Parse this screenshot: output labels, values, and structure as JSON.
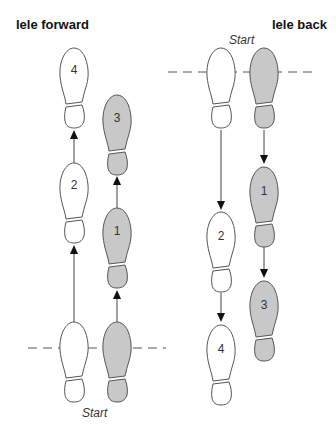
{
  "diagram": {
    "left": {
      "title": "lele forward",
      "start_label": "Start",
      "steps": [
        {
          "label": "1",
          "foot": "right",
          "fill": "#c8c8c8"
        },
        {
          "label": "2",
          "foot": "left",
          "fill": "#ffffff"
        },
        {
          "label": "3",
          "foot": "right",
          "fill": "#c8c8c8"
        },
        {
          "label": "4",
          "foot": "left",
          "fill": "#ffffff"
        }
      ]
    },
    "right": {
      "title": "lele back",
      "start_label": "Start",
      "steps": [
        {
          "label": "1",
          "foot": "right",
          "fill": "#c8c8c8"
        },
        {
          "label": "2",
          "foot": "left",
          "fill": "#ffffff"
        },
        {
          "label": "3",
          "foot": "right",
          "fill": "#c8c8c8"
        },
        {
          "label": "4",
          "foot": "left",
          "fill": "#ffffff"
        }
      ]
    },
    "colors": {
      "shaded_foot": "#c8c8c8",
      "outline": "#555555",
      "line": "#444444"
    }
  }
}
